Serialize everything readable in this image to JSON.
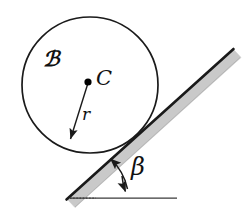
{
  "figure": {
    "background_color": "#ffffff",
    "width": 246,
    "height": 213,
    "labels": {
      "body": "ℬ",
      "center": "C",
      "radius": "r",
      "angle": "β"
    },
    "colors": {
      "outline": "#1a1a1a",
      "incline_edge": "#1a1a1a",
      "incline_fill": "#c9c9c9",
      "ground_line": "#444444",
      "center_dot": "#000000"
    },
    "geometry": {
      "circle": {
        "cx": 90,
        "cy": 85,
        "r": 68,
        "stroke_width": 1.6
      },
      "center_dot": {
        "cx": 88,
        "cy": 82,
        "r": 3.4
      },
      "radius_arrow": {
        "x1": 88,
        "y1": 82,
        "x2": 69,
        "y2": 142
      },
      "incline": {
        "x1": 67,
        "y1": 199,
        "x2": 233,
        "y2": 49,
        "band_thickness": 11,
        "angle_degrees": 42
      },
      "ground": {
        "x1": 70,
        "y1": 198,
        "x2": 177,
        "y2": 198,
        "stroke_width": 1.2
      },
      "angle_arc": {
        "vertex_x": 67,
        "vertex_y": 199,
        "radius": 58,
        "start_angle_degrees": 42,
        "end_angle_degrees": 0,
        "double_headed": true
      }
    }
  }
}
